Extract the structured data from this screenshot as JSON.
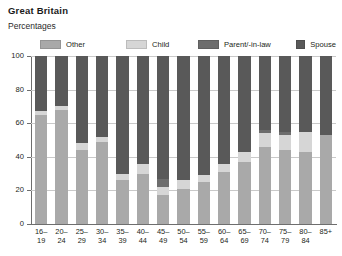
{
  "title": "Great Britain",
  "subtitle": "Percentages",
  "colors": {
    "other": "#a9a9a9",
    "child": "#d6d6d6",
    "parent": "#6d6d6d",
    "spouse": "#595959",
    "axis": "#6e6e6e",
    "grid": "#c9c9c9",
    "text": "#231f20"
  },
  "legend": {
    "items": [
      {
        "label": "Other",
        "key": "other"
      },
      {
        "label": "Child",
        "key": "child"
      },
      {
        "label": "Parent/-in-law",
        "key": "parent"
      },
      {
        "label": "Spouse",
        "key": "spouse"
      }
    ]
  },
  "axes": {
    "y_ticks": [
      "0",
      "20",
      "40",
      "60",
      "80",
      "100"
    ],
    "x_labels": [
      "16–\n19",
      "20–\n24",
      "25–\n29",
      "30–\n34",
      "35–\n39",
      "40–\n44",
      "45–\n49",
      "50–\n54",
      "55–\n59",
      "60–\n64",
      "65–\n69",
      "70–\n74",
      "75–\n79",
      "80–\n84",
      "85+"
    ]
  },
  "chart_data": {
    "type": "bar",
    "stacked": true,
    "stack_total": 100,
    "orientation": "vertical",
    "title": "Great Britain",
    "subtitle": "Percentages",
    "xlabel": "",
    "ylabel": "Percentages",
    "ylim": [
      0,
      100
    ],
    "yticks": [
      0,
      20,
      40,
      60,
      80,
      100
    ],
    "grid": true,
    "legend_position": "top",
    "categories": [
      "16–19",
      "20–24",
      "25–29",
      "30–34",
      "35–39",
      "40–44",
      "45–49",
      "50–54",
      "55–59",
      "60–64",
      "65–69",
      "70–74",
      "75–79",
      "80–84",
      "85+"
    ],
    "series": [
      {
        "name": "Other",
        "color": "#a9a9a9",
        "values": [
          65,
          68,
          44,
          49,
          26,
          30,
          17,
          21,
          25,
          31,
          37,
          46,
          44,
          43,
          53
        ]
      },
      {
        "name": "Child",
        "color": "#d6d6d6",
        "values": [
          2,
          2,
          4,
          3,
          4,
          6,
          5,
          5,
          4,
          5,
          6,
          8,
          9,
          12,
          0
        ]
      },
      {
        "name": "Parent/-in-law",
        "color": "#6d6d6d",
        "values": [
          0,
          0,
          0,
          0,
          0,
          0,
          5,
          0,
          0,
          0,
          0,
          2,
          2,
          0,
          0
        ]
      },
      {
        "name": "Spouse",
        "color": "#595959",
        "values": [
          33,
          30,
          52,
          48,
          70,
          64,
          73,
          74,
          71,
          64,
          57,
          44,
          45,
          45,
          47
        ]
      }
    ]
  }
}
